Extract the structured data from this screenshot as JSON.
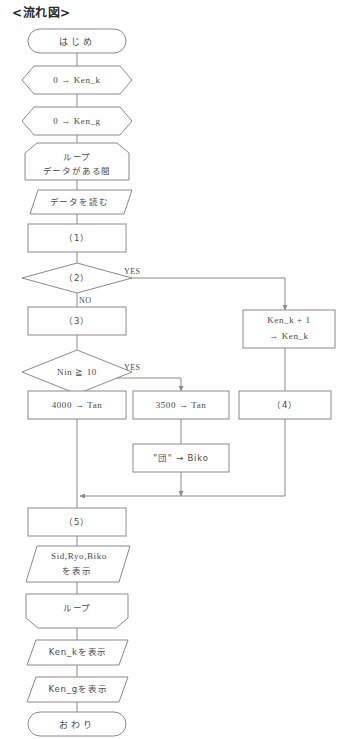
{
  "title": "<流れ図>",
  "colors": {
    "stroke": "#8a8a8a",
    "text": "#4a4a4a",
    "title": "#2b2b2b",
    "background": "#ffffff"
  },
  "nodes": {
    "start": {
      "label": "はじめ",
      "shape": "terminator"
    },
    "init_ken_k": {
      "label": "0 → Ken_k",
      "shape": "hexagon"
    },
    "init_ken_g": {
      "label": "0 → Ken_g",
      "shape": "hexagon"
    },
    "loop_start": {
      "line1": "ループ",
      "line2": "データがある間",
      "shape": "loop-start"
    },
    "read_data": {
      "label": "データを読む",
      "shape": "parallelogram"
    },
    "proc_1": {
      "label": "（1）",
      "shape": "process"
    },
    "decision_2": {
      "label": "（2）",
      "shape": "decision",
      "yes": "YES",
      "no": "NO"
    },
    "proc_3": {
      "label": "（3）",
      "shape": "process"
    },
    "decision_nin": {
      "label": "Nin ≧ 10",
      "shape": "decision",
      "yes": "YES",
      "no": "NO"
    },
    "ken_k_inc": {
      "line1": "Ken_k + 1",
      "line2": "→ Ken_k",
      "shape": "process"
    },
    "proc_4": {
      "label": "（4）",
      "shape": "process"
    },
    "tan_4000": {
      "label": "4000 → Tan",
      "shape": "process"
    },
    "tan_3500": {
      "label": "3500 → Tan",
      "shape": "process"
    },
    "biko_dan": {
      "label": "\"団\" → Biko",
      "shape": "process"
    },
    "proc_5": {
      "label": "（5）",
      "shape": "process"
    },
    "print_sid": {
      "line1": "Sid,Ryo,Biko",
      "line2": "を表示",
      "shape": "parallelogram"
    },
    "loop_end": {
      "label": "ループ",
      "shape": "loop-end"
    },
    "print_ken_k": {
      "label": "Ken_kを表示",
      "shape": "parallelogram"
    },
    "print_ken_g": {
      "label": "Ken_gを表示",
      "shape": "parallelogram"
    },
    "end": {
      "label": "おわり",
      "shape": "terminator"
    }
  }
}
